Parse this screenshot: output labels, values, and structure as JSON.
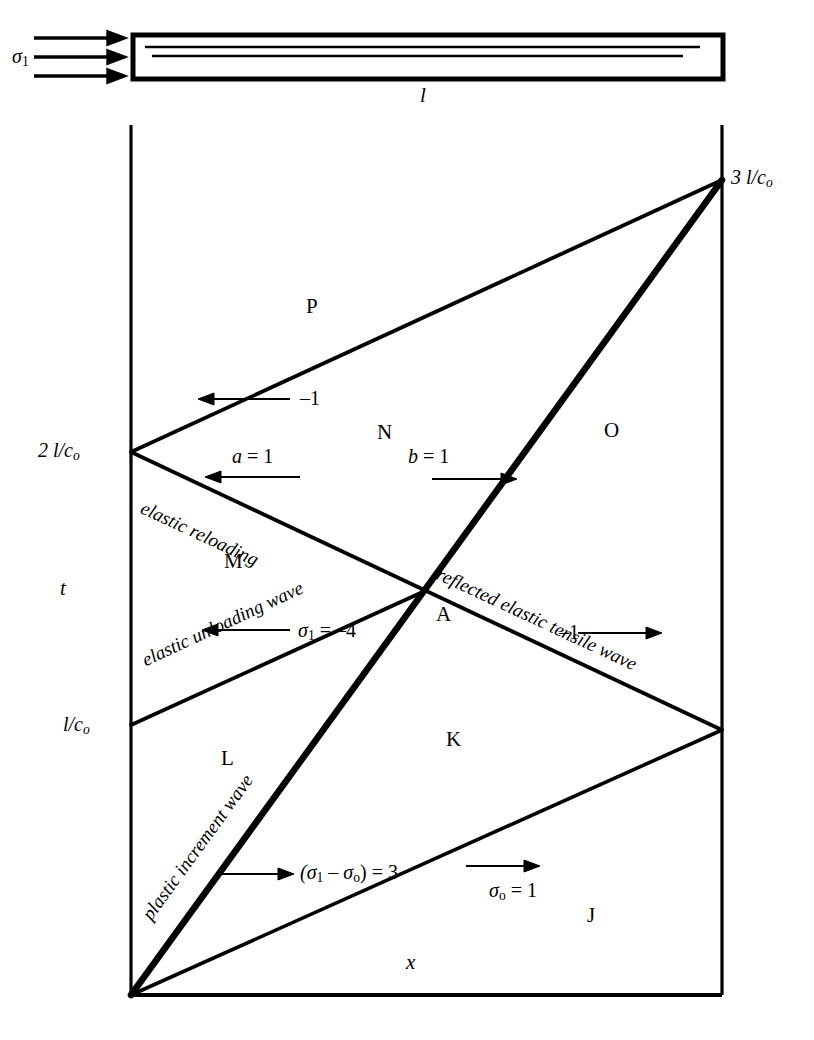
{
  "figure": {
    "type": "wave-propagation-x-t-diagram"
  },
  "specimen": {
    "stress_label": "σ",
    "stress_sub": "1",
    "length_label": "l",
    "arrow_count": 3
  },
  "axes": {
    "x_label": "x",
    "t_label": "t",
    "time_ticks": [
      {
        "id": "t1",
        "label": "l/c",
        "sub": "o"
      },
      {
        "id": "t2",
        "label": "2 l/c",
        "sub": "o"
      },
      {
        "id": "t3",
        "label": "3 l/c",
        "sub": "o"
      }
    ]
  },
  "regions": [
    {
      "id": "J",
      "label": "J"
    },
    {
      "id": "K",
      "label": "K"
    },
    {
      "id": "L",
      "label": "L"
    },
    {
      "id": "M",
      "label": "M"
    },
    {
      "id": "N",
      "label": "N"
    },
    {
      "id": "O",
      "label": "O"
    },
    {
      "id": "P",
      "label": "P"
    },
    {
      "id": "A",
      "label": "A"
    }
  ],
  "wave_labels": [
    {
      "id": "plastic-increment-wave",
      "text": "plastic increment wave"
    },
    {
      "id": "elastic-unloading-wave",
      "text": "elastic unloading wave"
    },
    {
      "id": "elastic-reloading",
      "text": "elastic reloading"
    },
    {
      "id": "reflected-elastic-tensile-wave",
      "text": "reflected elastic tensile wave"
    }
  ],
  "annotations": [
    {
      "id": "sigma0-eq-1",
      "text": "σ",
      "sub": "o",
      "tail": " = 1"
    },
    {
      "id": "sigma1-minus-sigma0-eq-3",
      "text": "(σ",
      "sub1": "1",
      "mid": " – σ",
      "sub2": "o",
      "tail": ") = 3"
    },
    {
      "id": "sigma1-eq-minus-4",
      "text": "σ",
      "sub": "1",
      "tail": " = –4"
    },
    {
      "id": "minus-1-right",
      "text": "–1"
    },
    {
      "id": "minus-1-upper",
      "text": "–1"
    },
    {
      "id": "a-eq-1",
      "text": "a",
      "tail": " = 1"
    },
    {
      "id": "b-eq-1",
      "text": "b",
      "tail": " = 1"
    }
  ],
  "colors": {
    "ink": "#000000",
    "paper": "#ffffff"
  }
}
